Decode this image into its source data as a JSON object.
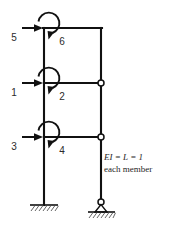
{
  "figure": {
    "ink_color": "#111111",
    "label_color": "#2b2b2b",
    "background": "#ffffff",
    "dof_labels": [
      {
        "id": "1",
        "text": "1",
        "type": "force",
        "x": 14,
        "y": 92
      },
      {
        "id": "2",
        "text": "2",
        "type": "moment",
        "x": 62,
        "y": 96
      },
      {
        "id": "3",
        "text": "3",
        "type": "force",
        "x": 14,
        "y": 146
      },
      {
        "id": "4",
        "text": "4",
        "type": "moment",
        "x": 62,
        "y": 150
      },
      {
        "id": "5",
        "text": "5",
        "type": "force",
        "x": 14,
        "y": 37
      },
      {
        "id": "6",
        "text": "6",
        "type": "moment",
        "x": 62,
        "y": 41
      }
    ],
    "note": {
      "line1": "EI = L = 1",
      "line2": "each member",
      "x": 104,
      "y1": 160,
      "y2": 172
    },
    "supports": {
      "left": {
        "type": "fixed",
        "x": 44,
        "y": 205
      },
      "right": {
        "type": "pin",
        "x": 101,
        "y": 205
      }
    },
    "hinges": [
      {
        "x": 101,
        "y": 83
      },
      {
        "x": 101,
        "y": 137
      }
    ],
    "geometry": {
      "left_column_x": 44,
      "right_column_x": 101,
      "beam_y_top": 28,
      "beam_y_mid": 83,
      "beam_y_bottom": 137,
      "base_y": 205
    }
  }
}
